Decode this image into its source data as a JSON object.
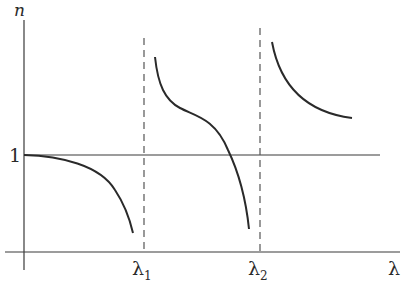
{
  "diagram": {
    "y_axis_label": "n",
    "x_axis_label": "λ",
    "reference_line_label": "1",
    "resonances": [
      {
        "label": "λ",
        "subscript": "1"
      },
      {
        "label": "λ",
        "subscript": "2"
      }
    ],
    "colors": {
      "curve": "#2a2a2a",
      "axis": "#3a3a3a",
      "dashed": "#555555",
      "background": "#ffffff"
    }
  }
}
